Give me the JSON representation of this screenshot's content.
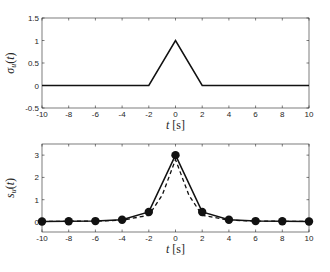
{
  "chart_data": [
    {
      "type": "line",
      "title": "",
      "xlabel": "t [s]",
      "ylabel": "σ_u(t)",
      "xlim": [
        -10,
        10
      ],
      "ylim": [
        -0.5,
        1.5
      ],
      "xticks": [
        "-10",
        "-8",
        "-6",
        "-4",
        "-2",
        "0",
        "2",
        "4",
        "6",
        "8",
        "10"
      ],
      "yticks": [
        "-0.5",
        "0",
        "0.5",
        "1",
        "1.5"
      ],
      "grid": false,
      "series": [
        {
          "name": "sigma_u",
          "style": "solid",
          "x": [
            -10,
            -2,
            0,
            2,
            10
          ],
          "y": [
            0,
            0,
            1,
            0,
            0
          ]
        }
      ]
    },
    {
      "type": "line",
      "title": "",
      "xlabel": "t [s]",
      "ylabel": "s_u(t)",
      "xlim": [
        -10,
        10
      ],
      "ylim": [
        -0.45,
        3.5
      ],
      "xticks": [
        "-10",
        "-8",
        "-6",
        "-4",
        "-2",
        "0",
        "2",
        "4",
        "6",
        "8",
        "10"
      ],
      "yticks": [
        "0",
        "1",
        "2",
        "3"
      ],
      "grid": false,
      "series": [
        {
          "name": "s_u sampled",
          "style": "solid-markers",
          "x": [
            -10,
            -8,
            -6,
            -4,
            -2,
            0,
            2,
            4,
            6,
            8,
            10
          ],
          "y": [
            0.02,
            0.03,
            0.04,
            0.1,
            0.45,
            3.0,
            0.45,
            0.1,
            0.04,
            0.03,
            0.02
          ]
        },
        {
          "name": "s_u continuous",
          "style": "dashed",
          "x": [
            -10,
            -8,
            -6,
            -4,
            -2,
            -1,
            0,
            1,
            2,
            4,
            6,
            8,
            10
          ],
          "y": [
            0.02,
            0.03,
            0.04,
            0.08,
            0.3,
            1.2,
            2.8,
            1.2,
            0.3,
            0.08,
            0.04,
            0.03,
            0.02
          ]
        }
      ]
    }
  ]
}
